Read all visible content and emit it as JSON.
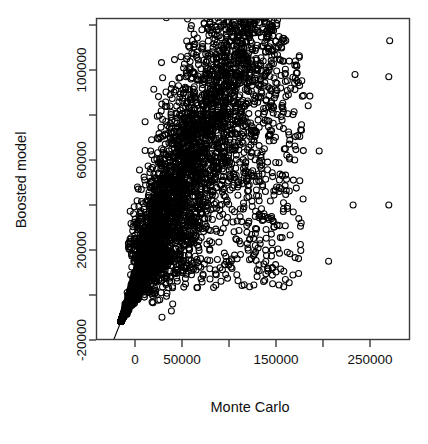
{
  "chart_data": {
    "type": "scatter",
    "title": "",
    "xlabel": "Monte Carlo",
    "ylabel": "Boosted model",
    "xlim": [
      -40000,
      285000
    ],
    "ylim": [
      -32000,
      128000
    ],
    "grid": false,
    "legend": null,
    "marker": {
      "shape": "circle",
      "filled": false,
      "color": "#000000",
      "size_px": 6
    },
    "x_ticks": [
      {
        "value": 0,
        "label": "0"
      },
      {
        "value": 50000,
        "label": "50000"
      },
      {
        "value": 100000,
        "label": ""
      },
      {
        "value": 150000,
        "label": "150000"
      },
      {
        "value": 200000,
        "label": ""
      },
      {
        "value": 250000,
        "label": "250000"
      }
    ],
    "y_ticks": [
      {
        "value": 120000,
        "label": ""
      },
      {
        "value": 100000,
        "label": "100000"
      },
      {
        "value": 80000,
        "label": ""
      },
      {
        "value": 60000,
        "label": "60000"
      },
      {
        "value": 40000,
        "label": ""
      },
      {
        "value": 20000,
        "label": "20000"
      },
      {
        "value": 0,
        "label": ""
      },
      {
        "value": -20000,
        "label": "-20000"
      }
    ],
    "reference_line": {
      "description": "identity line y = x",
      "slope": 1,
      "intercept": 0
    },
    "notable_outliers": [
      {
        "x": 271000,
        "y": 113000
      },
      {
        "x": 234000,
        "y": 98000
      },
      {
        "x": 270000,
        "y": 97000
      },
      {
        "x": 196000,
        "y": 64000
      },
      {
        "x": 232000,
        "y": 40000
      },
      {
        "x": 270000,
        "y": 40000
      },
      {
        "x": 206000,
        "y": 15000
      },
      {
        "x": 160000,
        "y": 65000
      },
      {
        "x": 158000,
        "y": 41000
      },
      {
        "x": 162000,
        "y": 19000
      }
    ],
    "n_points_approx": 4200
  },
  "axes": {
    "x_axis_title": "Monte Carlo",
    "y_axis_title": "Boosted model"
  }
}
